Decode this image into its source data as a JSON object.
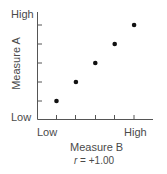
{
  "chart_data": {
    "type": "scatter",
    "title": "",
    "xlabel": "Measure B",
    "ylabel": "Measure A",
    "x_tick_labels": {
      "low": "Low",
      "high": "High"
    },
    "y_tick_labels": {
      "low": "Low",
      "high": "High"
    },
    "x": [
      1,
      2,
      3,
      4,
      5
    ],
    "y": [
      1,
      2,
      3,
      4,
      5
    ],
    "annotation": "r = +1.00",
    "xlim": [
      0,
      6
    ],
    "ylim": [
      0,
      6
    ],
    "grid": false,
    "legend": null
  },
  "labels": {
    "y_high": "High",
    "y_low": "Low",
    "x_low": "Low",
    "x_high": "High",
    "x_axis_title": "Measure B",
    "y_axis_title": "Measure A",
    "r_symbol": "r",
    "r_value": " = +1.00"
  }
}
